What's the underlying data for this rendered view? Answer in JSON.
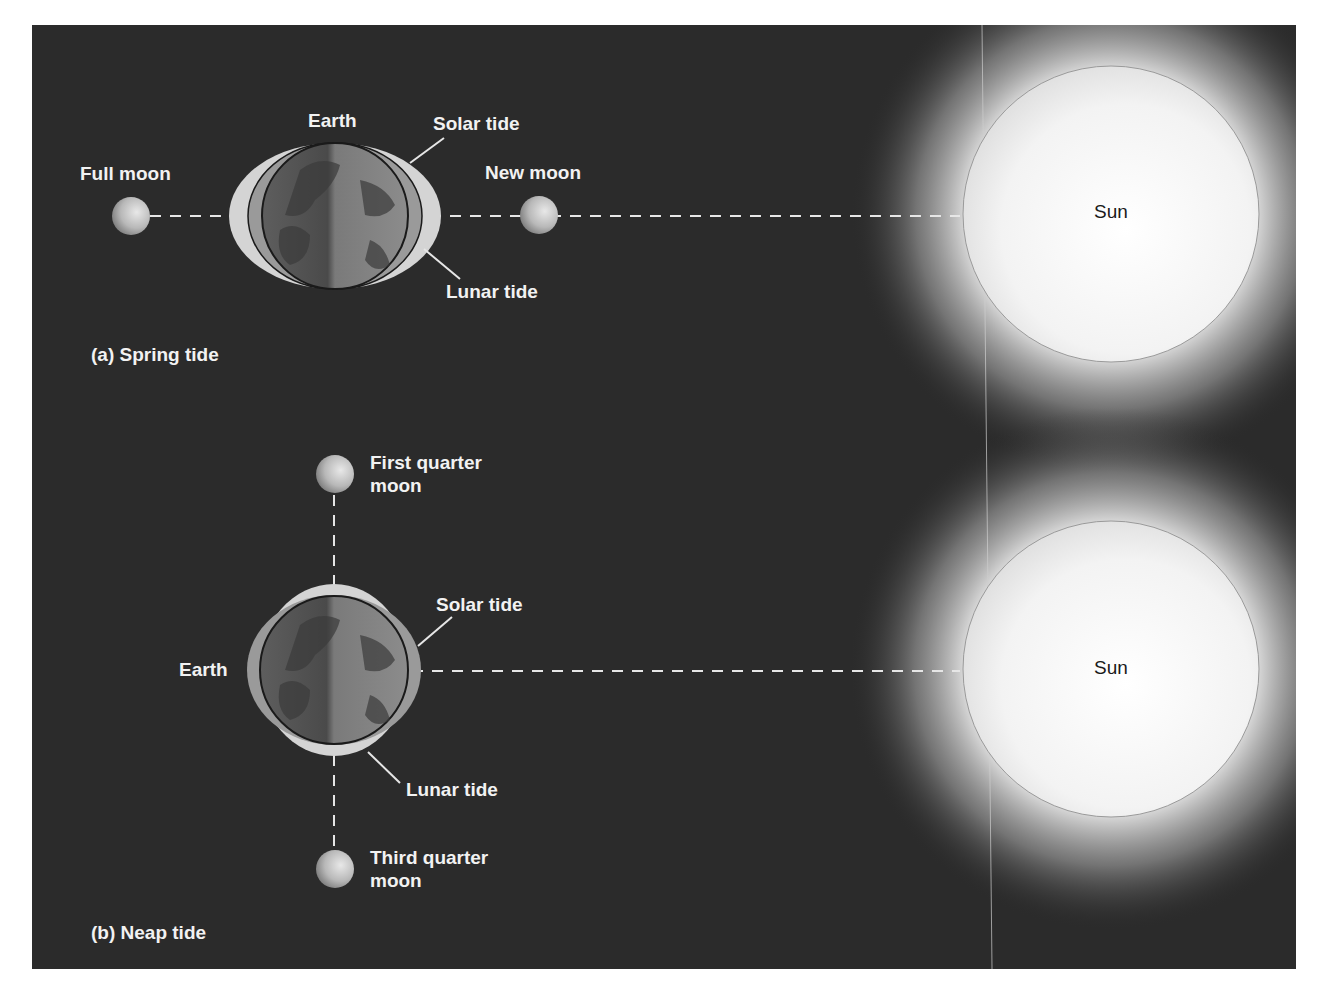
{
  "figure": {
    "panels": [
      {
        "id": "a",
        "caption": "(a) Spring tide",
        "labels": {
          "earth": "Earth",
          "solar_tide": "Solar tide",
          "lunar_tide": "Lunar tide",
          "full_moon": "Full moon",
          "new_moon": "New moon",
          "sun": "Sun"
        }
      },
      {
        "id": "b",
        "caption": "(b) Neap tide",
        "labels": {
          "earth": "Earth",
          "solar_tide": "Solar tide",
          "lunar_tide": "Lunar tide",
          "first_quarter_line1": "First quarter",
          "first_quarter_line2": "moon",
          "third_quarter_line1": "Third quarter",
          "third_quarter_line2": "moon",
          "sun": "Sun"
        }
      }
    ],
    "colors": {
      "background": "#2b2b2b",
      "lunar_bulge": "#d4d4d4",
      "solar_bulge": "#9a9a9a",
      "sun": "#f7f7f7",
      "label": "#f2f2f2"
    }
  }
}
